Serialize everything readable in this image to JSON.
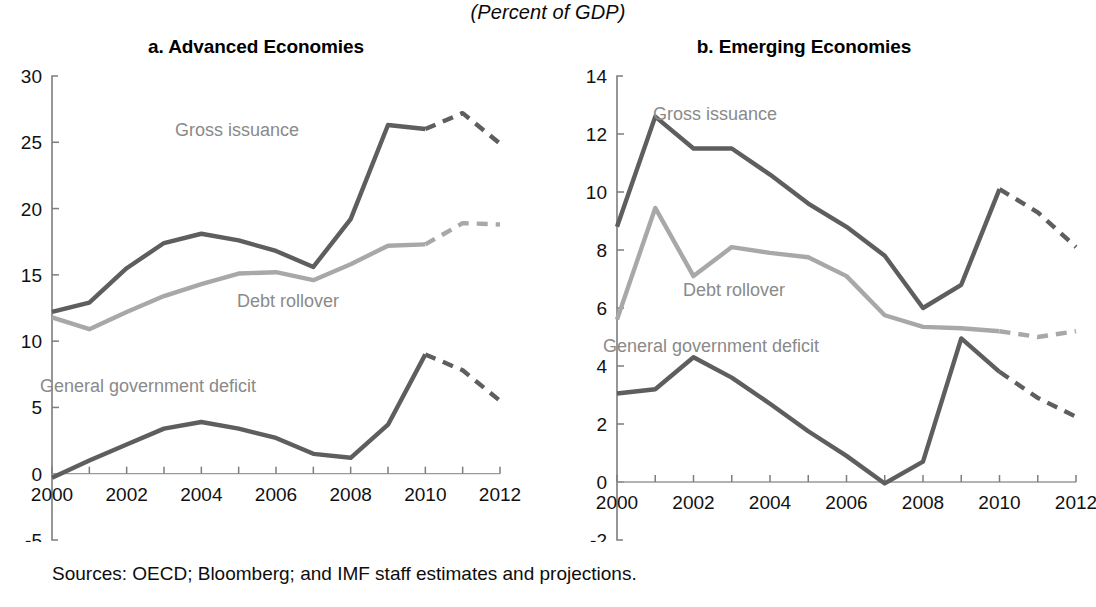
{
  "figure": {
    "units_title": "(Percent of GDP)",
    "source_note": "Sources: OECD; Bloomberg; and IMF staff estimates and projections."
  },
  "panels": {
    "a": {
      "title": "a. Advanced Economies",
      "series_labels": {
        "gross_issuance": "Gross issuance",
        "debt_rollover": "Debt rollover",
        "deficit": "General government deficit"
      },
      "y_ticks": [
        "-5",
        "0",
        "5",
        "10",
        "15",
        "20",
        "25",
        "30"
      ],
      "x_ticks": [
        "2000",
        "2002",
        "2004",
        "2006",
        "2008",
        "2010",
        "2012"
      ]
    },
    "b": {
      "title": "b. Emerging Economies",
      "series_labels": {
        "gross_issuance": "Gross issuance",
        "debt_rollover": "Debt rollover",
        "deficit": "General government deficit"
      },
      "y_ticks": [
        "-2",
        "0",
        "2",
        "4",
        "6",
        "8",
        "10",
        "12",
        "14"
      ],
      "x_ticks": [
        "2000",
        "2002",
        "2004",
        "2006",
        "2008",
        "2010",
        "2012"
      ]
    }
  },
  "colors": {
    "dark_line": "#5e5e5e",
    "light_line": "#a8a8a8",
    "axis": "#7d7d7d",
    "text": "#111111",
    "label_text": "#8a8a8a"
  },
  "chart_data": [
    {
      "type": "line",
      "id": "advanced-economies",
      "title": "a. Advanced Economies",
      "subtitle": "(Percent of GDP)",
      "xlabel": "",
      "ylabel": "",
      "xlim": [
        2000,
        2012
      ],
      "ylim": [
        -5,
        30
      ],
      "yticks": [
        -5,
        0,
        5,
        10,
        15,
        20,
        25,
        30
      ],
      "xticks": [
        2000,
        2002,
        2004,
        2006,
        2008,
        2010,
        2012
      ],
      "x": [
        2000,
        2001,
        2002,
        2003,
        2004,
        2005,
        2006,
        2007,
        2008,
        2009,
        2010,
        2011,
        2012
      ],
      "grid": false,
      "legend": "inline-annotations",
      "projection_starts_at": 2010,
      "series": [
        {
          "name": "Gross issuance",
          "color": "#5e5e5e",
          "values": [
            12.2,
            12.9,
            15.5,
            17.4,
            18.1,
            17.6,
            16.8,
            15.6,
            19.2,
            26.3,
            26.0,
            27.2,
            24.9
          ],
          "solid_through": 2010,
          "dashed_from": 2010
        },
        {
          "name": "Debt rollover",
          "color": "#a8a8a8",
          "values": [
            11.8,
            10.9,
            12.2,
            13.4,
            14.3,
            15.1,
            15.2,
            14.6,
            15.8,
            17.2,
            17.3,
            18.9,
            18.8
          ],
          "solid_through": 2010,
          "dashed_from": 2010
        },
        {
          "name": "General government deficit",
          "color": "#5e5e5e",
          "values": [
            -0.3,
            1.0,
            2.2,
            3.4,
            3.9,
            3.4,
            2.7,
            1.5,
            1.2,
            3.7,
            9.0,
            7.8,
            5.5
          ],
          "note": "series has an extra bend between 2008 and 2009 at about 3.7 before rising to 9.0 in 2009",
          "solid_through": 2010,
          "dashed_from": 2010
        }
      ]
    },
    {
      "type": "line",
      "id": "emerging-economies",
      "title": "b. Emerging Economies",
      "subtitle": "(Percent of GDP)",
      "xlabel": "",
      "ylabel": "",
      "xlim": [
        2000,
        2012
      ],
      "ylim": [
        -2,
        14
      ],
      "yticks": [
        -2,
        0,
        2,
        4,
        6,
        8,
        10,
        12,
        14
      ],
      "xticks": [
        2000,
        2002,
        2004,
        2006,
        2008,
        2010,
        2012
      ],
      "x": [
        2000,
        2001,
        2002,
        2003,
        2004,
        2005,
        2006,
        2007,
        2008,
        2009,
        2010,
        2011,
        2012
      ],
      "grid": false,
      "legend": "inline-annotations",
      "projection_starts_at": 2010,
      "series": [
        {
          "name": "Gross issuance",
          "color": "#5e5e5e",
          "values": [
            8.8,
            12.6,
            11.5,
            11.5,
            10.6,
            9.6,
            8.8,
            7.8,
            6.0,
            6.8,
            10.1,
            9.3,
            8.1
          ],
          "solid_through": 2010,
          "dashed_from": 2010
        },
        {
          "name": "Debt rollover",
          "color": "#a8a8a8",
          "values": [
            5.6,
            9.45,
            7.1,
            8.1,
            7.9,
            7.75,
            7.1,
            5.75,
            5.35,
            5.3,
            5.2,
            5.0,
            5.2
          ],
          "solid_through": 2010,
          "dashed_from": 2010
        },
        {
          "name": "General government deficit",
          "color": "#5e5e5e",
          "values": [
            3.05,
            3.2,
            4.3,
            3.6,
            2.7,
            1.75,
            0.9,
            -0.05,
            0.7,
            4.95,
            3.8,
            2.9,
            2.25
          ],
          "solid_through": 2010,
          "dashed_from": 2010
        }
      ]
    }
  ]
}
